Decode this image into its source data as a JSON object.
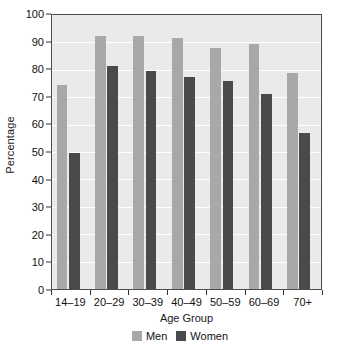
{
  "chart_data": {
    "type": "bar",
    "title": "",
    "xlabel": "Age Group",
    "ylabel": "Percentage",
    "categories": [
      "14–19",
      "20–29",
      "30–39",
      "40–49",
      "50–59",
      "60–69",
      "70+"
    ],
    "series": [
      {
        "name": "Men",
        "color": "#a8a8a8",
        "values": [
          74.5,
          92.5,
          92.5,
          91.5,
          88.0,
          89.5,
          79.0
        ]
      },
      {
        "name": "Women",
        "color": "#4a4a4a",
        "values": [
          49.5,
          81.5,
          79.5,
          77.5,
          76.0,
          71.0,
          57.0
        ]
      }
    ],
    "ylim": [
      0,
      100
    ],
    "yticks": [
      0,
      10,
      20,
      30,
      40,
      50,
      60,
      70,
      80,
      90,
      100
    ],
    "ytick_labels": [
      "0",
      "10",
      "20",
      "30",
      "40",
      "50",
      "60",
      "70",
      "80",
      "90",
      "100"
    ],
    "grid": true,
    "grid_axis": "y",
    "legend_position": "bottom",
    "plot_background": "#eaeaea",
    "gridline_color": "#ffffff",
    "axis_color": "#4d4d4d"
  }
}
